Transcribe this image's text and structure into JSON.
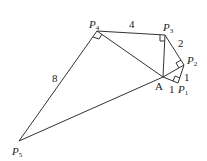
{
  "diagram": {
    "points": {
      "A": {
        "label": "A",
        "x": 163,
        "y": 77
      },
      "P1": {
        "label": "P",
        "sub": "1",
        "x": 178,
        "y": 83
      },
      "P2": {
        "label": "P",
        "sub": "2",
        "x": 184,
        "y": 65
      },
      "P3": {
        "label": "P",
        "sub": "3",
        "x": 165,
        "y": 35
      },
      "P4": {
        "label": "P",
        "sub": "4",
        "x": 97,
        "y": 31
      },
      "P5": {
        "label": "P",
        "sub": "5",
        "x": 19,
        "y": 141
      }
    },
    "edge_labels": {
      "AP1": "1",
      "P1P2": "1",
      "P2P3": "2",
      "P3P4": "4",
      "P4P5": "8"
    },
    "right_angles": [
      "P1",
      "P2",
      "P3",
      "P4"
    ]
  }
}
